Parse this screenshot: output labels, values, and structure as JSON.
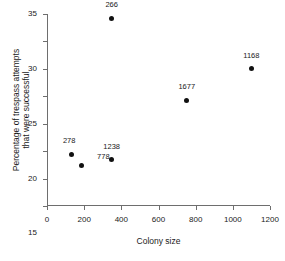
{
  "chart_data": {
    "type": "scatter",
    "title": "",
    "xlabel": "Colony size",
    "ylabel_lines": [
      "Percentage of trespass attempts",
      "that were successful"
    ],
    "ylabel": "Percentage of trespass attempts that were successful",
    "xlim": [
      0,
      1200
    ],
    "ylim": [
      0,
      35
    ],
    "xticks": [
      0,
      200,
      400,
      600,
      800,
      1000,
      1200
    ],
    "yticks": [
      0,
      5,
      10,
      15,
      20,
      25,
      30,
      35
    ],
    "xticklabels": [
      "0",
      "200",
      "400",
      "600",
      "800",
      "1000",
      "1200"
    ],
    "yticklabels": [
      "0",
      "5",
      "10",
      "15",
      "20",
      "25",
      "30",
      "35"
    ],
    "grid": false,
    "legend": false,
    "marker_color": "#111111",
    "axis_color": "#6e6e6e",
    "background": "#ffffff",
    "points": [
      {
        "label": "278",
        "x": 130,
        "y": 9.4,
        "label_dx": -2,
        "label_dy": -13
      },
      {
        "label": "778",
        "x": 185,
        "y": 7.3,
        "label_dx": 22,
        "label_dy": -9
      },
      {
        "label": "1238",
        "x": 348,
        "y": 8.4,
        "label_dx": 0,
        "label_dy": -13
      },
      {
        "label": "266",
        "x": 348,
        "y": 34.2,
        "label_dx": 0,
        "label_dy": -13
      },
      {
        "label": "1677",
        "x": 752,
        "y": 19.3,
        "label_dx": 0,
        "label_dy": -13
      },
      {
        "label": "1168",
        "x": 1100,
        "y": 25.0,
        "label_dx": 0,
        "label_dy": -13
      }
    ]
  }
}
